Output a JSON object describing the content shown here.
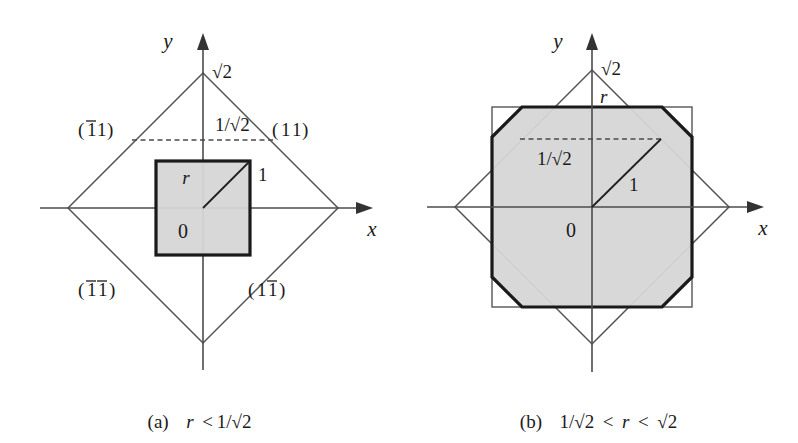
{
  "figure": {
    "title": "",
    "background": "#ffffff",
    "accent_fill": "#d6d6d6",
    "accent_stroke": "#1a1a1a",
    "thin_stroke": "#555555"
  },
  "panels": [
    {
      "id": "a",
      "caption_prefix": "(a)",
      "caption_var": "r",
      "caption_rel": "< 1/",
      "caption_sqrt": "√2",
      "caption_full": "(a)  r < 1/√2",
      "axes": {
        "x_label": "x",
        "y_label": "y",
        "origin_label": "0"
      },
      "labels": {
        "diamond_vertex": "√2",
        "dashed_value": "1/√2",
        "square_side": "r",
        "diagonal": "1",
        "miller_11": "(11)",
        "miller_m11": "(1́1)",
        "miller_m1m1": "(́1́1)",
        "miller_1m1": "(1́1)"
      },
      "miller": {
        "top_left_first": "1",
        "top_left_second": "1",
        "top_right_first": "1",
        "top_right_second": "1",
        "bottom_left_first": "1",
        "bottom_left_second": "1",
        "bottom_right_first": "1",
        "bottom_right_second": "1"
      },
      "geometry": {
        "origin_x": 203,
        "origin_y": 208,
        "sqrt2_px": 135,
        "unit_px": 95.5,
        "inv_sqrt2_px": 68,
        "square_half_px": 47,
        "note": "shaded square is |x|<r,|y|<r with r < 1/sqrt2"
      }
    },
    {
      "id": "b",
      "caption_prefix": "(b)",
      "caption_var": "r",
      "caption_full": "(b)  1/√2 < r < √2",
      "axes": {
        "x_label": "x",
        "y_label": "y",
        "origin_label": "0"
      },
      "labels": {
        "diamond_vertex": "√2",
        "dashed_value": "1/√2",
        "square_side": "r",
        "diagonal": "1"
      },
      "geometry": {
        "origin_x": 193,
        "origin_y": 207,
        "sqrt2_px": 137,
        "unit_px": 96.9,
        "inv_sqrt2_px": 68,
        "square_half_px": 100,
        "note": "shaded octagon = intersection of square |x|,|y|<r with diamond |x|+|y|<sqrt2"
      }
    }
  ],
  "captions": {
    "a": {
      "prefix": "(a)",
      "body": "r < 1/√2"
    },
    "b": {
      "prefix": "(b)",
      "body": "1/√2 < r < √2"
    }
  },
  "symbols": {
    "sqrt2": "√2",
    "inv_sqrt2": "1/√2",
    "one": "1",
    "r": "r",
    "zero": "0",
    "less": "<",
    "x": "x",
    "y": "y"
  }
}
